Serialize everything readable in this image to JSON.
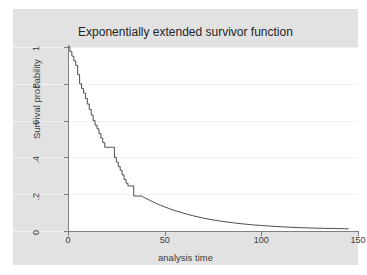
{
  "chart_data": {
    "type": "line",
    "title": "Exponentially extended survivor function",
    "xlabel": "analysis time",
    "ylabel": "Survival probability",
    "xlim": [
      0,
      150
    ],
    "ylim": [
      0,
      1
    ],
    "xticks": [
      0,
      50,
      100,
      150
    ],
    "xtick_labels": [
      "0",
      "50",
      "100",
      "150"
    ],
    "yticks": [
      0,
      0.2,
      0.4,
      0.6,
      0.8,
      1
    ],
    "ytick_labels": [
      "0",
      ".2",
      ".4",
      ".6",
      ".8",
      "1"
    ],
    "grid": "horizontal",
    "legend": "none",
    "line_color": "#4d4d4d",
    "plot_bgcolor": "#ffffff",
    "graph_bgcolor": "#e2e2e2",
    "series": [
      {
        "name": "Kaplan-Meier step (observed)",
        "style": "step",
        "points": [
          [
            0,
            1.0
          ],
          [
            1,
            0.975
          ],
          [
            2,
            0.95
          ],
          [
            3,
            0.925
          ],
          [
            4,
            0.9
          ],
          [
            5,
            0.85
          ],
          [
            6,
            0.8
          ],
          [
            7,
            0.775
          ],
          [
            8,
            0.75
          ],
          [
            9,
            0.72
          ],
          [
            10,
            0.69
          ],
          [
            11,
            0.66
          ],
          [
            12,
            0.63
          ],
          [
            13,
            0.6
          ],
          [
            14,
            0.575
          ],
          [
            15,
            0.555
          ],
          [
            16,
            0.53
          ],
          [
            17,
            0.505
          ],
          [
            18,
            0.48
          ],
          [
            19,
            0.455
          ],
          [
            20,
            0.455
          ],
          [
            22,
            0.455
          ],
          [
            23,
            0.455
          ],
          [
            24,
            0.4
          ],
          [
            25,
            0.375
          ],
          [
            26,
            0.35
          ],
          [
            27,
            0.33
          ],
          [
            28,
            0.305
          ],
          [
            29,
            0.28
          ],
          [
            30,
            0.26
          ],
          [
            31,
            0.245
          ],
          [
            32,
            0.245
          ],
          [
            33,
            0.245
          ],
          [
            34,
            0.19
          ],
          [
            36,
            0.19
          ],
          [
            38,
            0.19
          ]
        ]
      },
      {
        "name": "Exponential extension (smooth tail)",
        "style": "smooth",
        "points": [
          [
            38,
            0.19
          ],
          [
            42,
            0.168
          ],
          [
            46,
            0.148
          ],
          [
            50,
            0.131
          ],
          [
            55,
            0.112
          ],
          [
            60,
            0.096
          ],
          [
            65,
            0.082
          ],
          [
            70,
            0.07
          ],
          [
            75,
            0.06
          ],
          [
            80,
            0.052
          ],
          [
            85,
            0.045
          ],
          [
            90,
            0.039
          ],
          [
            95,
            0.034
          ],
          [
            100,
            0.03
          ],
          [
            110,
            0.023
          ],
          [
            120,
            0.018
          ],
          [
            130,
            0.015
          ],
          [
            140,
            0.013
          ],
          [
            145,
            0.012
          ]
        ]
      }
    ]
  }
}
